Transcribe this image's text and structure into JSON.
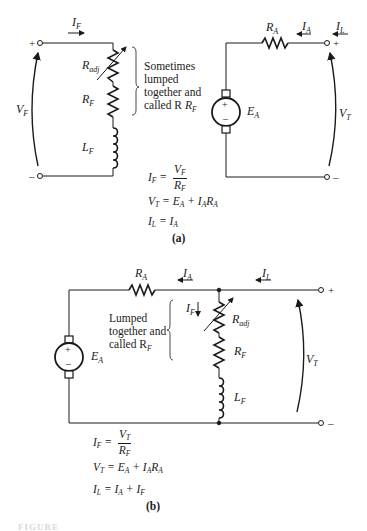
{
  "figure": {
    "part_a": {
      "caption": "(a)",
      "field_circuit": {
        "current_label": "I",
        "current_sub": "F",
        "voltage_label": "V",
        "voltage_sub": "F",
        "plus": "+",
        "minus": "–",
        "r_adj_label": "R",
        "r_adj_sub": "adj",
        "r_f_label": "R",
        "r_f_sub": "F",
        "l_f_label": "L",
        "l_f_sub": "F",
        "note_lines": [
          "Sometimes",
          "lumped",
          "together and",
          "called R"
        ],
        "note_sub": "F"
      },
      "armature_circuit": {
        "r_a_label": "R",
        "r_a_sub": "A",
        "i_a_label": "I",
        "i_a_sub": "A",
        "i_l_label": "I",
        "i_l_sub": "L",
        "e_a_label": "E",
        "e_a_sub": "A",
        "v_t_label": "V",
        "v_t_sub": "T",
        "plus": "+",
        "minus": "–",
        "gen_plus": "+",
        "gen_minus": "–"
      },
      "equations": [
        {
          "lhs": "I_F =",
          "num": "V_F",
          "den": "R_F"
        },
        {
          "text": "V_T = E_A + I_A R_A"
        },
        {
          "text": "I_L = I_A"
        }
      ]
    },
    "part_b": {
      "caption": "(b)",
      "r_a_label": "R",
      "r_a_sub": "A",
      "i_a_label": "I",
      "i_a_sub": "A",
      "i_l_label": "I",
      "i_l_sub": "L",
      "i_f_label": "I",
      "i_f_sub": "F",
      "e_a_label": "E",
      "e_a_sub": "A",
      "v_t_label": "V",
      "v_t_sub": "T",
      "r_adj_label": "R",
      "r_adj_sub": "adj",
      "r_f_label": "R",
      "r_f_sub": "F",
      "l_f_label": "L",
      "l_f_sub": "F",
      "plus": "+",
      "minus": "–",
      "gen_plus": "+",
      "gen_minus": "–",
      "note_lines": [
        "Lumped",
        "together and",
        "called R"
      ],
      "note_sub": "F",
      "equations": [
        {
          "lhs": "I_F =",
          "num": "V_T",
          "den": "R_F"
        },
        {
          "text": "V_T = E_A + I_A R_A"
        },
        {
          "text": "I_L = I_A + I_F"
        }
      ]
    },
    "footer_label": "FIGURE"
  }
}
